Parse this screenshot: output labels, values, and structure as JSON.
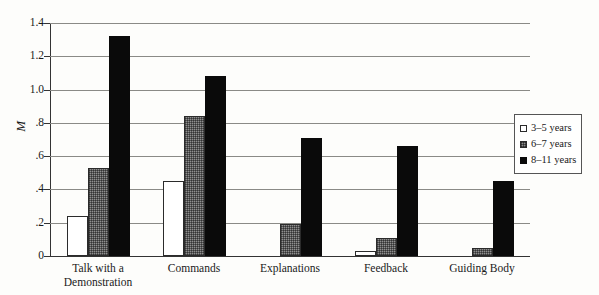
{
  "chart_data": {
    "type": "bar",
    "title": "",
    "xlabel": "",
    "ylabel": "M",
    "ylim": [
      0,
      1.4
    ],
    "grid": true,
    "legend_position": "right",
    "ytick_labels": [
      "1.4",
      "1.2",
      "1.0",
      ".8",
      ".6",
      ".4",
      ".2",
      "0"
    ],
    "ytick_values": [
      1.4,
      1.2,
      1.0,
      0.8,
      0.6,
      0.4,
      0.2,
      0
    ],
    "categories": [
      "Talk with a Demonstration",
      "Commands",
      "Explanations",
      "Feedback",
      "Guiding Body"
    ],
    "category_lines": [
      [
        "Talk with a",
        "Demonstration"
      ],
      [
        "Commands"
      ],
      [
        "Explanations"
      ],
      [
        "Feedback"
      ],
      [
        "Guiding Body"
      ]
    ],
    "series": [
      {
        "name": "3–5 years",
        "values": [
          0.24,
          0.45,
          0.0,
          0.03,
          0.0
        ]
      },
      {
        "name": "6–7 years",
        "values": [
          0.53,
          0.84,
          0.19,
          0.11,
          0.05
        ]
      },
      {
        "name": "8–11 years",
        "values": [
          1.32,
          1.08,
          0.71,
          0.66,
          0.45
        ]
      }
    ]
  },
  "legend": {
    "items": [
      {
        "label": "3–5 years"
      },
      {
        "label": "6–7 years"
      },
      {
        "label": "8–11 years"
      }
    ]
  }
}
